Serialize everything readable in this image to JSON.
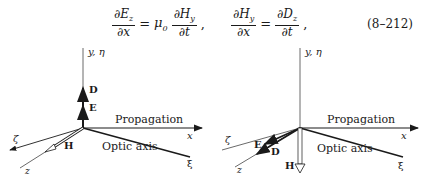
{
  "equation": {
    "lhs1_num": "∂E",
    "lhs1_num_sub": "z",
    "lhs1_den": "∂x",
    "eq1": "=",
    "coef": "μ",
    "coef_sub": "0",
    "rhs1_num": "∂H",
    "rhs1_num_sub": "y",
    "rhs1_den": "∂t",
    "sep1": ",",
    "lhs2_num": "∂H",
    "lhs2_num_sub": "y",
    "lhs2_den": "∂x",
    "eq2": "=",
    "rhs2_num": "∂D",
    "rhs2_num_sub": "z",
    "rhs2_den": "∂t",
    "sep2": ",",
    "number": "(8–212)"
  },
  "diagram_left": {
    "y_axis_label": "y, η",
    "x_axis_label": "x",
    "propagation_label": "Propagation",
    "optic_axis_label": "Optic axis",
    "xi_label": "ξ",
    "zeta_label": "ζ",
    "z_label": "z",
    "vector_D": "D",
    "vector_E": "E",
    "vector_H": "H"
  },
  "diagram_right": {
    "y_axis_label": "y, η",
    "x_axis_label": "x",
    "propagation_label": "Propagation",
    "optic_axis_label": "Optic axis",
    "xi_label": "ξ",
    "zeta_label": "ζ",
    "z_label": "z",
    "vector_E": "E",
    "vector_D": "D",
    "vector_H": "H"
  }
}
